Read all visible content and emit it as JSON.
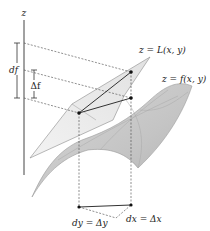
{
  "figure": {
    "type": "linear-approximation-diagram",
    "axis_label": "z",
    "labels": {
      "tangent_plane": "z = L(x, y)",
      "surface": "z = f(x, y)",
      "df": "df",
      "delta_f": "Δf",
      "dy": "dy = Δy",
      "dx": "dx = Δx"
    },
    "colors": {
      "surface_fill": "#c8c8c8",
      "surface_edge": "#9a9a9a",
      "plane_fill": "#e4e4e4",
      "plane_edge": "#8a8a8a",
      "line": "#333333",
      "point": "#111111"
    }
  }
}
